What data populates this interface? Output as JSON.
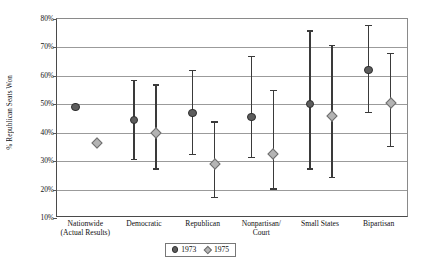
{
  "chart_data": {
    "type": "scatter",
    "title": "",
    "subtitle": "",
    "xlabel": "",
    "ylabel": "% Republican Seats Won",
    "ylim": [
      10,
      80
    ],
    "ytick_labels": [
      "80%",
      "70%",
      "60%",
      "50%",
      "40%",
      "30%",
      "20%",
      "10%"
    ],
    "ytick_values": [
      80,
      70,
      60,
      50,
      40,
      30,
      20,
      10
    ],
    "grid": true,
    "legend_position": "bottom",
    "categories": [
      "Nationwide (Actual Results)",
      "Democratic",
      "Republican",
      "Nonpartisan/ Court",
      "Small States",
      "Bipartisan"
    ],
    "category_lines": [
      [
        "Nationwide",
        "(Actual Results)"
      ],
      [
        "Democratic"
      ],
      [
        "Republican"
      ],
      [
        "Nonpartisan/",
        "Court"
      ],
      [
        "Small States"
      ],
      [
        "Bipartisan"
      ]
    ],
    "series": [
      {
        "name": "1973",
        "color": "#5d5d5d",
        "marker": "circle",
        "values": [
          49.0,
          44.5,
          47.0,
          45.5,
          50.0,
          62.0
        ],
        "high": [
          null,
          58.5,
          62.0,
          67.0,
          76.0,
          78.0
        ],
        "low": [
          null,
          30.5,
          32.0,
          31.0,
          27.0,
          47.0
        ]
      },
      {
        "name": "1975",
        "color": "#b4b4b4",
        "marker": "diamond",
        "values": [
          36.5,
          40.0,
          29.0,
          32.5,
          46.0,
          50.5
        ],
        "high": [
          null,
          57.0,
          44.0,
          55.0,
          71.0,
          68.0
        ],
        "low": [
          null,
          27.0,
          17.0,
          20.0,
          24.0,
          35.0
        ]
      }
    ]
  },
  "legend": {
    "items": [
      {
        "label": "1973"
      },
      {
        "label": "1975"
      }
    ]
  }
}
